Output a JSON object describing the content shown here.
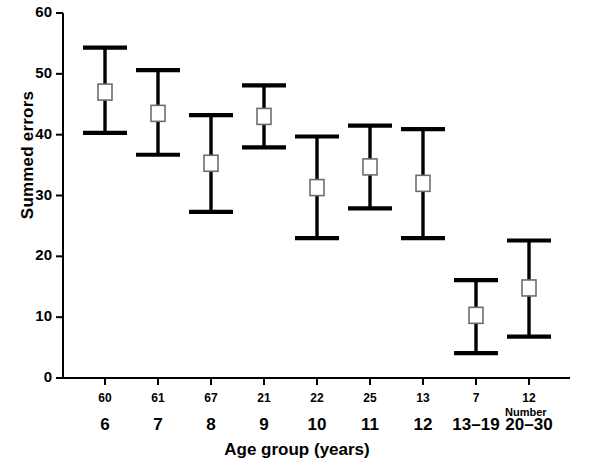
{
  "chart_data": {
    "type": "scatter",
    "title": "",
    "xlabel": "Age group (years)",
    "ylabel": "Summed errors",
    "ylim": [
      0,
      60
    ],
    "yticks": [
      0,
      10,
      20,
      30,
      40,
      50,
      60
    ],
    "grid": false,
    "legend": null,
    "marker": "open-square",
    "errorbar_style": "capped-vertical",
    "categories": [
      "6",
      "7",
      "8",
      "9",
      "10",
      "11",
      "12",
      "13–19",
      "20–30"
    ],
    "counts": [
      60,
      61,
      67,
      21,
      22,
      25,
      13,
      7,
      12
    ],
    "counts_row_label": "Number",
    "values": [
      47.0,
      43.5,
      35.3,
      43.0,
      31.3,
      34.7,
      32.0,
      10.3,
      14.8
    ],
    "error_low": [
      40.3,
      36.7,
      27.3,
      37.9,
      23.0,
      27.9,
      23.0,
      4.1,
      6.8
    ],
    "error_high": [
      54.3,
      50.6,
      43.2,
      48.1,
      39.7,
      41.5,
      40.9,
      16.1,
      22.6
    ],
    "points": [
      {
        "category": "6",
        "count": 60,
        "mean": 47.0,
        "low": 40.3,
        "high": 54.3
      },
      {
        "category": "7",
        "count": 61,
        "mean": 43.5,
        "low": 36.7,
        "high": 50.6
      },
      {
        "category": "8",
        "count": 67,
        "mean": 35.3,
        "low": 27.3,
        "high": 43.2
      },
      {
        "category": "9",
        "count": 21,
        "mean": 43.0,
        "low": 37.9,
        "high": 48.1
      },
      {
        "category": "10",
        "count": 22,
        "mean": 31.3,
        "low": 23.0,
        "high": 39.7
      },
      {
        "category": "11",
        "count": 25,
        "mean": 34.7,
        "low": 27.9,
        "high": 41.5
      },
      {
        "category": "12",
        "count": 13,
        "mean": 32.0,
        "low": 23.0,
        "high": 40.9
      },
      {
        "category": "13–19",
        "count": 7,
        "mean": 10.3,
        "low": 4.1,
        "high": 16.1
      },
      {
        "category": "20–30",
        "count": 12,
        "mean": 14.8,
        "low": 6.8,
        "high": 22.6
      }
    ]
  },
  "axis": {
    "y_tick_labels": [
      "60",
      "50",
      "40",
      "30",
      "20",
      "10",
      "0"
    ],
    "y_title": "Summed errors",
    "x_title": "Age group (years)"
  },
  "colors": {
    "background": "#ffffff",
    "ink": "#000000",
    "marker_fill": "#ffffff",
    "marker_edge": "#6e6e6e"
  }
}
